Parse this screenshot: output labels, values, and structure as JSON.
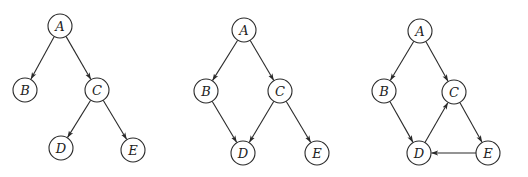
{
  "node_radius": 12,
  "colors": {
    "stroke": "#2a2a2a",
    "background": "#ffffff",
    "text": "#222222"
  },
  "graphs": [
    {
      "id": "graph-1",
      "description": "Tree",
      "nodes": [
        {
          "id": "A",
          "label": "A",
          "x": 60,
          "y": 26
        },
        {
          "id": "B",
          "label": "B",
          "x": 25,
          "y": 90
        },
        {
          "id": "C",
          "label": "C",
          "x": 97,
          "y": 90
        },
        {
          "id": "D",
          "label": "D",
          "x": 61,
          "y": 148
        },
        {
          "id": "E",
          "label": "E",
          "x": 133,
          "y": 150
        }
      ],
      "edges": [
        {
          "from": "A",
          "to": "B"
        },
        {
          "from": "A",
          "to": "C"
        },
        {
          "from": "C",
          "to": "D"
        },
        {
          "from": "C",
          "to": "E"
        }
      ]
    },
    {
      "id": "graph-2",
      "description": "Directed acyclic graph",
      "nodes": [
        {
          "id": "A",
          "label": "A",
          "x": 244,
          "y": 30
        },
        {
          "id": "B",
          "label": "B",
          "x": 206,
          "y": 91
        },
        {
          "id": "C",
          "label": "C",
          "x": 280,
          "y": 91
        },
        {
          "id": "D",
          "label": "D",
          "x": 243,
          "y": 153
        },
        {
          "id": "E",
          "label": "E",
          "x": 317,
          "y": 153
        }
      ],
      "edges": [
        {
          "from": "A",
          "to": "B"
        },
        {
          "from": "A",
          "to": "C"
        },
        {
          "from": "B",
          "to": "D"
        },
        {
          "from": "C",
          "to": "D"
        },
        {
          "from": "C",
          "to": "E"
        }
      ]
    },
    {
      "id": "graph-3",
      "description": "Directed graph with cycle",
      "nodes": [
        {
          "id": "A",
          "label": "A",
          "x": 420,
          "y": 31
        },
        {
          "id": "B",
          "label": "B",
          "x": 384,
          "y": 91
        },
        {
          "id": "C",
          "label": "C",
          "x": 454,
          "y": 92
        },
        {
          "id": "D",
          "label": "D",
          "x": 419,
          "y": 153
        },
        {
          "id": "E",
          "label": "E",
          "x": 488,
          "y": 153
        }
      ],
      "edges": [
        {
          "from": "A",
          "to": "B"
        },
        {
          "from": "A",
          "to": "C"
        },
        {
          "from": "B",
          "to": "D"
        },
        {
          "from": "D",
          "to": "C"
        },
        {
          "from": "C",
          "to": "E"
        },
        {
          "from": "E",
          "to": "D"
        }
      ]
    }
  ]
}
